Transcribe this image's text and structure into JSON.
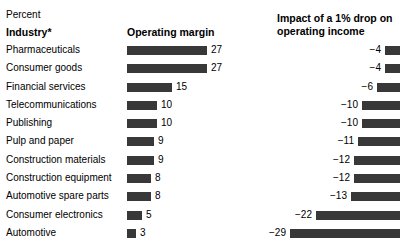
{
  "header": {
    "unit_label": "Percent",
    "industry_label": "Industry*",
    "margin_label": "Operating margin",
    "impact_label": "Impact of a 1% drop on operating income"
  },
  "style": {
    "bar_color": "#383838",
    "background": "#ffffff",
    "text_color": "#000000"
  },
  "chart_data": {
    "type": "bar",
    "title": "",
    "subtitle": "Percent",
    "xlabel": "",
    "ylabel": "Industry*",
    "grid": false,
    "legend": "none",
    "orientation": "horizontal",
    "categories": [
      "Pharmaceuticals",
      "Consumer goods",
      "Financial services",
      "Telecommunications",
      "Publishing",
      "Pulp and paper",
      "Construction materials",
      "Construction equipment",
      "Automotive spare parts",
      "Consumer electronics",
      "Automotive"
    ],
    "series": [
      {
        "name": "Operating margin",
        "direction": "right",
        "values": [
          27,
          27,
          15,
          10,
          10,
          9,
          9,
          8,
          8,
          5,
          3
        ],
        "labels": [
          "27",
          "27",
          "15",
          "10",
          "10",
          "9",
          "9",
          "8",
          "8",
          "5",
          "3"
        ],
        "xlim": [
          0,
          30
        ]
      },
      {
        "name": "Impact of a 1% drop on operating income",
        "direction": "left",
        "values": [
          -4,
          -4,
          -6,
          -10,
          -10,
          -11,
          -12,
          -12,
          -13,
          -22,
          -29
        ],
        "labels": [
          "−4",
          "−4",
          "−6",
          "−10",
          "−10",
          "−11",
          "−12",
          "−12",
          "−13",
          "−22",
          "−29"
        ],
        "xlim": [
          -30,
          0
        ]
      }
    ]
  }
}
